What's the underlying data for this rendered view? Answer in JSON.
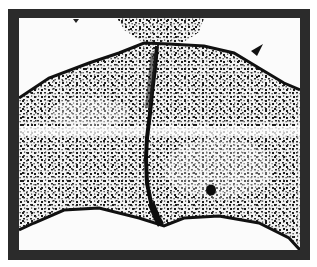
{
  "image": {
    "description": "Black and white histological micrograph showing a tissue section with a dense speckled cellular pattern, a dark vertical median fissure, and a pale horizontal band, enclosed by a thick dark frame",
    "colors": {
      "frame": "#2b2b2b",
      "background": "#fbfbfb",
      "tissue": "#e8e8e8",
      "cells": "#1a1a1a"
    }
  }
}
